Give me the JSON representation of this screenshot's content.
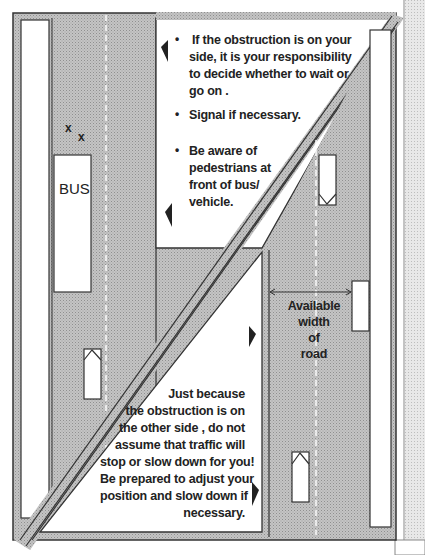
{
  "diagram": {
    "colors": {
      "road_fill": "#bdbdbd",
      "verge_fill": "#ffffff",
      "outline": "#333333",
      "text": "#222222",
      "arrow": "#222222"
    },
    "top_panel": {
      "bullets": [
        {
          "id": "b1",
          "text_lines": [
            "If the obstruction is on your",
            "side, it is your responsibility",
            "to decide whether to wait or",
            "go on ."
          ]
        },
        {
          "id": "b2",
          "text_lines": [
            "Signal if necessary."
          ]
        },
        {
          "id": "b3",
          "text_lines": [
            "Be aware of",
            "pedestrians at",
            "front of bus/",
            "vehicle."
          ]
        }
      ]
    },
    "bottom_panel": {
      "text_lines": [
        "Just because",
        "the obstruction is on",
        "the other side , do not",
        "assume that traffic will",
        "stop or slow down for you!",
        "Be prepared to adjust your",
        "position and slow down if",
        "necessary."
      ]
    },
    "road_labels": {
      "bus": "BUS",
      "x_marks": [
        "x",
        "x"
      ],
      "available_width": [
        "Available",
        "width",
        "of",
        "road"
      ]
    },
    "icons": {
      "arrows": [
        "arrow-left-icon",
        "arrow-left-icon",
        "arrow-right-icon",
        "arrow-right-icon"
      ],
      "vehicles": [
        "car-up-icon (left lane)",
        "car-down-icon (right road, top)",
        "car-up-icon (right road, bottom)",
        "parked-vehicle-icon"
      ]
    }
  }
}
